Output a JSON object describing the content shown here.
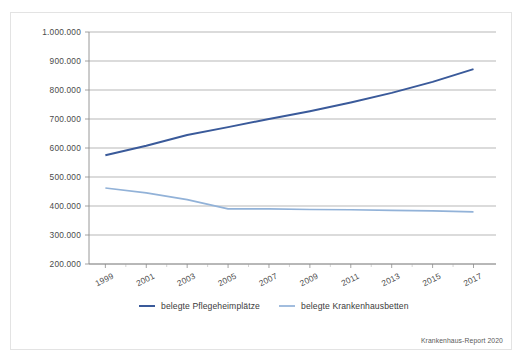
{
  "chart_data": {
    "type": "line",
    "title": "",
    "subtitle": "",
    "xlabel": "",
    "ylabel": "",
    "x": [
      1999,
      2001,
      2003,
      2005,
      2007,
      2009,
      2011,
      2013,
      2015,
      2017
    ],
    "xtick_labels": [
      "1999",
      "2001",
      "2003",
      "2005",
      "2007",
      "2009",
      "2011",
      "2013",
      "2015",
      "2017"
    ],
    "ytick_labels": [
      "200.000",
      "300.000",
      "400.000",
      "500.000",
      "600.000",
      "700.000",
      "800.000",
      "900.000",
      "1.000.000"
    ],
    "ytick_values": [
      200000,
      300000,
      400000,
      500000,
      600000,
      700000,
      800000,
      900000,
      1000000
    ],
    "xlim": [
      1998.2,
      2018.1
    ],
    "ylim": [
      200000,
      1000000
    ],
    "grid": true,
    "legend_position": "bottom",
    "series": [
      {
        "name": "belegte Pflegeheimplätze",
        "color": "#3a5a9a",
        "x": [
          1999,
          2001,
          2003,
          2005,
          2007,
          2009,
          2011,
          2013,
          2015,
          2017
        ],
        "values": [
          575000,
          608000,
          645000,
          672000,
          700000,
          727000,
          757000,
          790000,
          828000,
          872000
        ]
      },
      {
        "name": "belegte Krankenhausbetten",
        "color": "#92b2d8",
        "x": [
          1999,
          2001,
          2003,
          2005,
          2007,
          2009,
          2011,
          2013,
          2015,
          2017
        ],
        "values": [
          462000,
          445000,
          422000,
          390000,
          390000,
          388000,
          387000,
          385000,
          383000,
          380000
        ]
      }
    ],
    "annotations": [
      {
        "name": "source",
        "text": "Krankenhaus-Report 2020"
      }
    ]
  },
  "legend": {
    "items": [
      {
        "label": "belegte Pflegeheimplätze",
        "color": "#3a5a9a"
      },
      {
        "label": "belegte Krankenhausbetten",
        "color": "#92b2d8"
      }
    ]
  },
  "source": {
    "text": "Krankenhaus-Report 2020"
  }
}
